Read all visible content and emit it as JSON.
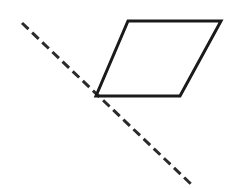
{
  "canvas": {
    "width": 227,
    "height": 188,
    "background_color": "#ffffff"
  },
  "figure": {
    "shapes": [
      {
        "name": "parallelogram",
        "kind": "polygon",
        "stroke_color": "#1a1a1a",
        "stroke_width": 3,
        "fill": "none",
        "line_style": "solid",
        "points": "128,21 221,21 180,96 96,96",
        "vertices": [
          {
            "label": "top-left",
            "x": 128,
            "y": 21
          },
          {
            "label": "top-right",
            "x": 221,
            "y": 21
          },
          {
            "label": "bottom-right",
            "x": 180,
            "y": 96
          },
          {
            "label": "bottom-left",
            "x": 96,
            "y": 96
          }
        ]
      },
      {
        "name": "dashed-line",
        "kind": "line",
        "stroke_color": "#2b2b2b",
        "stroke_width": 3,
        "line_style": "dashed",
        "dash_pattern": "9 5",
        "x1": 22,
        "y1": 23,
        "x2": 192,
        "y2": 185
      }
    ]
  }
}
